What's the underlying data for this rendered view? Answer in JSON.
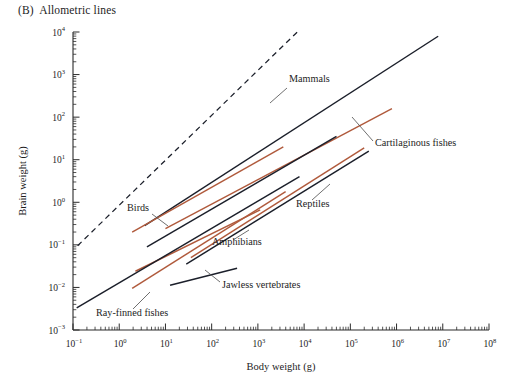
{
  "figure": {
    "panel_letter": "(B)",
    "panel_title": "Allometric lines",
    "title_full": "(B)  Allometric lines"
  },
  "chart_data": {
    "type": "line",
    "title": "(B)  Allometric lines",
    "xlabel": "Body weight (g)",
    "ylabel": "Brain weight (g)",
    "xscale": "log",
    "yscale": "log",
    "xlim": [
      -1,
      8
    ],
    "ylim": [
      -3,
      4
    ],
    "grid": false,
    "legend": "inline-annotations",
    "x_tick_labels": [
      "10−1",
      "10⁰",
      "10¹",
      "10²",
      "10³",
      "10⁴",
      "10⁵",
      "10⁶",
      "10⁷",
      "10⁸"
    ],
    "x_tick_exponents": [
      "-1",
      "0",
      "1",
      "2",
      "3",
      "4",
      "5",
      "6",
      "7",
      "8"
    ],
    "y_tick_labels": [
      "10⁴",
      "10³",
      "10²",
      "10¹",
      "10⁰",
      "10−1",
      "10−2",
      "10−3"
    ],
    "y_tick_exponents": [
      "4",
      "3",
      "2",
      "1",
      "0",
      "-1",
      "-2",
      "-3"
    ],
    "colors": {
      "dark": "#1b1f2a",
      "red": "#b05a3c",
      "axis": "#2a2a2a",
      "text": "#1d1d1d",
      "leader": "#555555"
    },
    "series": [
      {
        "name": "reference-dashed",
        "label": "",
        "color": "#1b1f2a",
        "style": "dashed",
        "x_start": -0.9,
        "x_end": 3.9,
        "y_start": -1.02,
        "y_end": 4.05,
        "slope": 1.06
      },
      {
        "name": "Mammals",
        "label": "Mammals",
        "color": "#1b1f2a",
        "style": "solid",
        "x_start": 0.55,
        "x_end": 6.9,
        "y_start": -0.55,
        "y_end": 3.9,
        "slope": 0.7,
        "label_x": 289,
        "label_y": 82,
        "leader": [
          [
            287,
            88
          ],
          [
            270,
            103
          ]
        ]
      },
      {
        "name": "Cartilaginous fishes",
        "label": "Cartilaginous fishes",
        "color": "#b05a3c",
        "style": "solid",
        "x_start": 1.0,
        "x_end": 5.9,
        "y_start": -0.62,
        "y_end": 2.2,
        "slope": 0.58,
        "label_x": 375,
        "label_y": 146,
        "leader": [
          [
            373,
            141
          ],
          [
            352,
            117
          ]
        ]
      },
      {
        "name": "Birds",
        "label": "Birds",
        "color": "#1b1f2a",
        "style": "solid",
        "x_start": 0.6,
        "x_end": 4.7,
        "y_start": -1.05,
        "y_end": 1.55,
        "slope": 0.63,
        "label_x": 127,
        "label_y": 211,
        "leader": [
          [
            152,
            214
          ],
          [
            168,
            226
          ]
        ]
      },
      {
        "name": "Birds-red",
        "label": "",
        "color": "#b05a3c",
        "style": "solid",
        "x_start": 0.28,
        "x_end": 3.55,
        "y_start": -0.7,
        "y_end": 1.3,
        "slope": 0.61
      },
      {
        "name": "Reptiles",
        "label": "Reptiles",
        "color": "#1b1f2a",
        "style": "solid",
        "x_start": 1.45,
        "x_end": 5.4,
        "y_start": -1.45,
        "y_end": 1.2,
        "slope": 0.67,
        "label_x": 296,
        "label_y": 207,
        "leader": [
          [
            312,
            200
          ],
          [
            330,
            184
          ]
        ]
      },
      {
        "name": "Reptiles-red",
        "label": "",
        "color": "#b05a3c",
        "style": "solid",
        "x_start": 1.55,
        "x_end": 5.3,
        "y_start": -1.3,
        "y_end": 1.28,
        "slope": 0.69
      },
      {
        "name": "Amphibians",
        "label": "Amphibians",
        "color": "#b05a3c",
        "style": "solid",
        "x_start": 0.35,
        "x_end": 3.05,
        "y_start": -1.62,
        "y_end": -0.18,
        "slope": 0.53,
        "label_x": 212,
        "label_y": 245,
        "leader": [
          [
            233,
            240
          ],
          [
            249,
            230
          ]
        ]
      },
      {
        "name": "Ray-finned fishes",
        "label": "Ray-finned fishes",
        "color": "#1b1f2a",
        "style": "solid",
        "x_start": -0.92,
        "x_end": 3.9,
        "y_start": -2.48,
        "y_end": 0.6,
        "slope": 0.64,
        "label_x": 96,
        "label_y": 316,
        "leader": [
          [
            133,
            309
          ],
          [
            150,
            292
          ]
        ]
      },
      {
        "name": "Ray-finned-red",
        "label": "",
        "color": "#b05a3c",
        "style": "solid",
        "x_start": 0.28,
        "x_end": 3.6,
        "y_start": -2.02,
        "y_end": 0.25,
        "slope": 0.68
      },
      {
        "name": "Jawless vertebrates",
        "label": "Jawless vertebrates",
        "color": "#1b1f2a",
        "style": "solid",
        "x_start": 1.1,
        "x_end": 2.55,
        "y_start": -1.95,
        "y_end": -1.55,
        "slope": 0.27,
        "label_x": 222,
        "label_y": 288,
        "leader": [
          [
            220,
            282
          ],
          [
            205,
            270
          ]
        ]
      }
    ]
  }
}
